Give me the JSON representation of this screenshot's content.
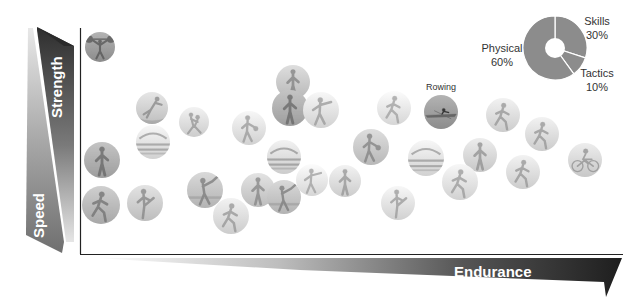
{
  "axes": {
    "y_top_label": "Strength",
    "y_bottom_label": "Speed",
    "x_label": "Endurance"
  },
  "chart_data": {
    "type": "pie",
    "title": "",
    "categories": [
      "Skills",
      "Tactics",
      "Physical"
    ],
    "values": [
      30,
      10,
      60
    ],
    "labels": [
      "Skills 30%",
      "Tactics 10%",
      "Physical 60%"
    ],
    "style": "donut",
    "legend_position": "labels around donut"
  },
  "pie": {
    "skills": {
      "name": "Skills",
      "pct": "30%"
    },
    "tactics": {
      "name": "Tactics",
      "pct": "10%"
    },
    "physical": {
      "name": "Physical",
      "pct": "60%"
    },
    "color": "#8c8c8c"
  },
  "colors": {
    "axis_dark": "#2b2b2b",
    "axis_mid": "#8a8a8a",
    "axis_light": "#d0d0d0",
    "frame": "#222222"
  },
  "sports": [
    {
      "name": "weightlifting",
      "x": 100,
      "y": 47,
      "r": 15,
      "tone": 0.55,
      "icon": "lift"
    },
    {
      "name": "gymnastics",
      "x": 152,
      "y": 108,
      "r": 16,
      "tone": 0.75,
      "icon": "gym"
    },
    {
      "name": "synchronized-swimming",
      "x": 153,
      "y": 142,
      "r": 17,
      "tone": 0.82,
      "icon": "pool"
    },
    {
      "name": "judo",
      "x": 194,
      "y": 122,
      "r": 15,
      "tone": 0.8,
      "icon": "fight"
    },
    {
      "name": "hurdles",
      "x": 102,
      "y": 160,
      "r": 18,
      "tone": 0.62,
      "icon": "stand"
    },
    {
      "name": "sprint",
      "x": 101,
      "y": 205,
      "r": 19,
      "tone": 0.66,
      "icon": "run"
    },
    {
      "name": "karate",
      "x": 145,
      "y": 203,
      "r": 18,
      "tone": 0.74,
      "icon": "kick"
    },
    {
      "name": "baseball",
      "x": 205,
      "y": 190,
      "r": 18,
      "tone": 0.7,
      "icon": "bat"
    },
    {
      "name": "tennis",
      "x": 231,
      "y": 216,
      "r": 18,
      "tone": 0.8,
      "icon": "run"
    },
    {
      "name": "basketball",
      "x": 249,
      "y": 128,
      "r": 17,
      "tone": 0.82,
      "icon": "ball"
    },
    {
      "name": "fencing",
      "x": 293,
      "y": 82,
      "r": 17,
      "tone": 0.72,
      "icon": "stand"
    },
    {
      "name": "handball",
      "x": 290,
      "y": 108,
      "r": 18,
      "tone": 0.62,
      "icon": "stand"
    },
    {
      "name": "american-football",
      "x": 321,
      "y": 110,
      "r": 18,
      "tone": 0.82,
      "icon": "throw"
    },
    {
      "name": "swimming",
      "x": 284,
      "y": 157,
      "r": 17,
      "tone": 0.8,
      "icon": "pool"
    },
    {
      "name": "volleyball",
      "x": 258,
      "y": 190,
      "r": 17,
      "tone": 0.74,
      "icon": "stand"
    },
    {
      "name": "field-hockey",
      "x": 284,
      "y": 197,
      "r": 17,
      "tone": 0.7,
      "icon": "bat"
    },
    {
      "name": "badminton",
      "x": 312,
      "y": 180,
      "r": 16,
      "tone": 0.84,
      "icon": "throw"
    },
    {
      "name": "cricket",
      "x": 345,
      "y": 181,
      "r": 16,
      "tone": 0.8,
      "icon": "stand"
    },
    {
      "name": "rugby",
      "x": 371,
      "y": 147,
      "r": 18,
      "tone": 0.72,
      "icon": "ball"
    },
    {
      "name": "soccer",
      "x": 398,
      "y": 203,
      "r": 17,
      "tone": 0.82,
      "icon": "kick"
    },
    {
      "name": "athletics",
      "x": 394,
      "y": 108,
      "r": 17,
      "tone": 0.84,
      "icon": "run"
    },
    {
      "name": "rowing",
      "x": 441,
      "y": 112,
      "r": 17,
      "tone": 0.55,
      "icon": "boat",
      "label": "Rowing"
    },
    {
      "name": "water-polo",
      "x": 426,
      "y": 158,
      "r": 18,
      "tone": 0.82,
      "icon": "pool"
    },
    {
      "name": "middle-distance",
      "x": 503,
      "y": 115,
      "r": 17,
      "tone": 0.8,
      "icon": "run"
    },
    {
      "name": "triathlon",
      "x": 480,
      "y": 155,
      "r": 17,
      "tone": 0.78,
      "icon": "stand"
    },
    {
      "name": "cross-country",
      "x": 460,
      "y": 182,
      "r": 18,
      "tone": 0.82,
      "icon": "run"
    },
    {
      "name": "marathon",
      "x": 523,
      "y": 172,
      "r": 17,
      "tone": 0.8,
      "icon": "run"
    },
    {
      "name": "long-distance",
      "x": 542,
      "y": 134,
      "r": 17,
      "tone": 0.8,
      "icon": "run"
    },
    {
      "name": "cycling",
      "x": 585,
      "y": 160,
      "r": 17,
      "tone": 0.78,
      "icon": "bike"
    }
  ]
}
